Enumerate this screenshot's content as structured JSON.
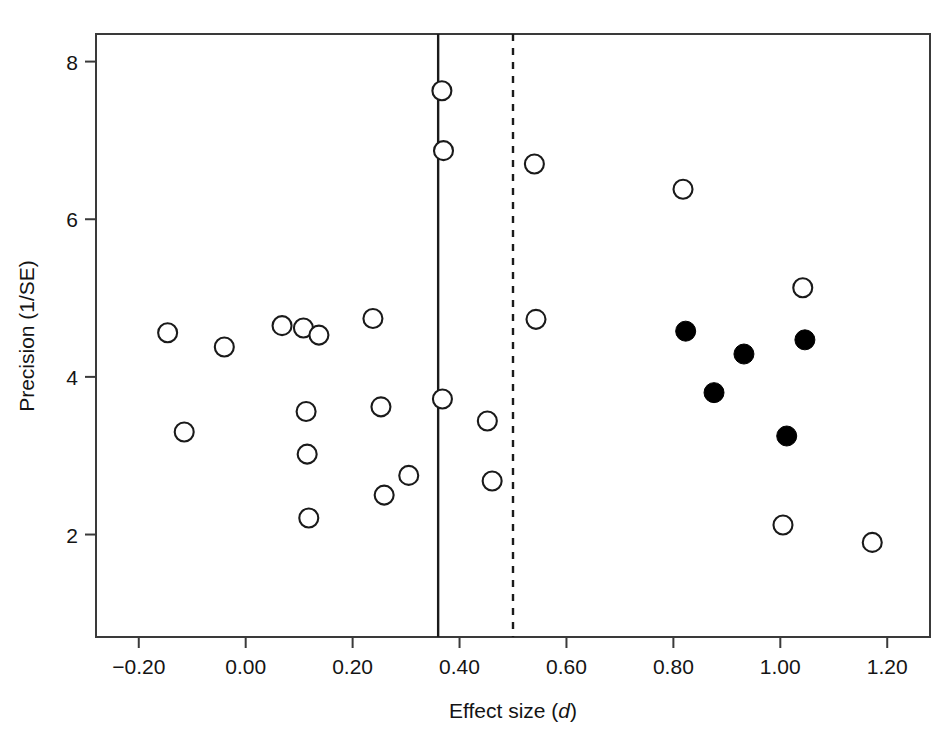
{
  "chart_data": {
    "type": "scatter",
    "title": "",
    "xlabel": "Effect size (d)",
    "ylabel": "Precision (1/SE)",
    "xlim": [
      -0.28,
      1.28
    ],
    "ylim": [
      0.7,
      8.35
    ],
    "grid": false,
    "legend": "none",
    "xticks": [
      -0.2,
      0.0,
      0.2,
      0.4,
      0.6,
      0.8,
      1.0,
      1.2
    ],
    "xtick_labels": [
      "-0.20",
      "0.00",
      "0.20",
      "0.40",
      "0.60",
      "0.80",
      "1.00",
      "1.20"
    ],
    "yticks": [
      2,
      4,
      6,
      8
    ],
    "ytick_labels": [
      "2",
      "4",
      "6",
      "8"
    ],
    "reference_lines": [
      {
        "name": "observed-mean-effect",
        "x": 0.36,
        "style": "solid"
      },
      {
        "name": "adjusted-mean-effect",
        "x": 0.5,
        "style": "dashed"
      }
    ],
    "series": [
      {
        "name": "Observed studies",
        "marker": "open-circle",
        "fill": "#ffffff",
        "stroke": "#1a1a1a",
        "points": [
          {
            "x": -0.146,
            "y": 4.56
          },
          {
            "x": -0.115,
            "y": 3.3
          },
          {
            "x": -0.04,
            "y": 4.38
          },
          {
            "x": 0.068,
            "y": 4.65
          },
          {
            "x": 0.108,
            "y": 4.62
          },
          {
            "x": 0.113,
            "y": 3.56
          },
          {
            "x": 0.115,
            "y": 3.02
          },
          {
            "x": 0.118,
            "y": 2.21
          },
          {
            "x": 0.137,
            "y": 4.53
          },
          {
            "x": 0.238,
            "y": 4.74
          },
          {
            "x": 0.253,
            "y": 3.62
          },
          {
            "x": 0.259,
            "y": 2.5
          },
          {
            "x": 0.305,
            "y": 2.75
          },
          {
            "x": 0.367,
            "y": 7.63
          },
          {
            "x": 0.37,
            "y": 6.87
          },
          {
            "x": 0.368,
            "y": 3.72
          },
          {
            "x": 0.452,
            "y": 3.44
          },
          {
            "x": 0.461,
            "y": 2.68
          },
          {
            "x": 0.54,
            "y": 6.7
          },
          {
            "x": 0.543,
            "y": 4.73
          },
          {
            "x": 0.818,
            "y": 6.38
          },
          {
            "x": 1.042,
            "y": 5.13
          },
          {
            "x": 1.005,
            "y": 2.12
          },
          {
            "x": 1.172,
            "y": 1.9
          }
        ]
      },
      {
        "name": "Imputed studies",
        "marker": "filled-circle",
        "fill": "#000000",
        "stroke": "#000000",
        "points": [
          {
            "x": 0.823,
            "y": 4.58
          },
          {
            "x": 0.876,
            "y": 3.8
          },
          {
            "x": 0.932,
            "y": 4.29
          },
          {
            "x": 1.012,
            "y": 3.25
          },
          {
            "x": 1.046,
            "y": 4.47
          }
        ]
      }
    ]
  },
  "axes": {
    "x_title_main": "Effect size (",
    "x_title_italic": "d",
    "x_title_close": ")",
    "y_title": "Precision (1/SE)"
  },
  "colors": {
    "axis": "#333333",
    "marker_open_stroke": "#262626",
    "marker_filled": "#000000",
    "background": "#ffffff"
  }
}
